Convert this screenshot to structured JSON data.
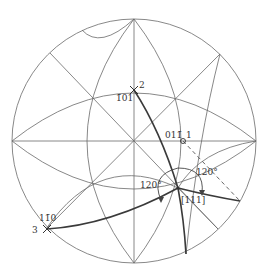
{
  "diagram": {
    "type": "stereographic-projection",
    "primitive_circle": {
      "cx": 134,
      "cy": 141,
      "r": 122
    },
    "poles": [
      {
        "id": "p2",
        "number": "2",
        "index": "1̄01",
        "x": 134,
        "y": 90
      },
      {
        "id": "p1",
        "number": "1",
        "index": "011̄",
        "x": 183,
        "y": 141
      },
      {
        "id": "p3",
        "number": "3",
        "index": "11̄0",
        "x": 47,
        "y": 229
      },
      {
        "id": "p111",
        "number": "",
        "index": "[111]",
        "x": 178,
        "y": 188
      }
    ],
    "angle_labels": [
      {
        "id": "angle-left",
        "text": "120°"
      },
      {
        "id": "angle-right",
        "text": "120°"
      }
    ],
    "colors": {
      "line": "#6a6a6a",
      "thick": "#3a3a3a",
      "text": "#333333"
    }
  }
}
